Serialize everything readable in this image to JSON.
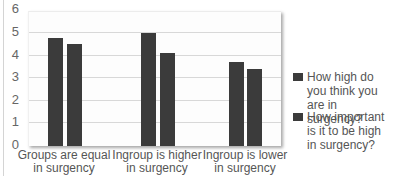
{
  "chart_data": {
    "type": "bar",
    "title": "",
    "xlabel": "",
    "ylabel": "",
    "ylim": [
      0,
      6
    ],
    "yticks": [
      "0",
      "1",
      "2",
      "3",
      "4",
      "5",
      "6"
    ],
    "grid": true,
    "legend_position": "right",
    "categories": [
      "Groups are equal in surgency",
      "Ingroup is higher in surgency",
      "Ingroup is lower in surgency"
    ],
    "series": [
      {
        "name": "How high do you think you are in surgency?",
        "values": [
          4.85,
          5.05,
          3.75
        ],
        "color": "#3b3b3b"
      },
      {
        "name": "How important is it to be high in surgency?",
        "values": [
          4.55,
          4.15,
          3.45
        ],
        "color": "#3b3b3b"
      }
    ]
  },
  "axis": {
    "ticks": [
      "6",
      "5",
      "4",
      "3",
      "2",
      "1",
      "0"
    ]
  },
  "xlabels": [
    {
      "line1": "Groups are equal",
      "line2": "in surgency"
    },
    {
      "line1": "Ingroup is higher",
      "line2": "in surgency"
    },
    {
      "line1": "Ingroup is lower",
      "line2": "in surgency"
    }
  ],
  "legend": [
    {
      "line1": "How high do",
      "line2": "you think you",
      "line3": "are in surgency?"
    },
    {
      "line1": "How important",
      "line2": "is it to be high",
      "line3": "in surgency?"
    }
  ]
}
